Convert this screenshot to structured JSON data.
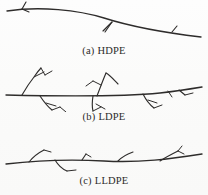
{
  "figure": {
    "background_color": "#fdfdfd",
    "ink_color": "#2e2c2b",
    "panel_count": 3
  },
  "panels": [
    {
      "id": "hdpe",
      "caption_tag": "(a)",
      "caption_label": "HDPE",
      "caption_full": "(a) HDPE",
      "description": "linear chain with very few short branches",
      "main_chain_path": "M 7,11 C 40,6 78,10 104,18 C 126,25 150,31 201,37",
      "branches": [
        "M 22,9 L 26,2",
        "M 22,9 L 29,12",
        "M 112,22 L 103,31",
        "M 112,22 L 105,32",
        "M 172,32 L 177,26"
      ]
    },
    {
      "id": "ldpe",
      "caption_tag": "(b)",
      "caption_label": "LDPE",
      "caption_full": "(b) LDPE",
      "description": "highly branched chain with long branches bearing sub-branches",
      "main_chain_path": "M 6,33 C 50,34 120,35 160,31 C 178,29 190,27 202,25",
      "branches": [
        "M 22,33 C 26,26 30,20 34,15 C 36,12 38,9 41,6",
        "M 34,15 L 44,10",
        "M 41,6 L 45,13",
        "M 45,13 L 52,9",
        "M 40,34 C 44,40 48,45 52,48",
        "M 46,41 L 56,44",
        "M 52,48 L 60,45",
        "M 60,45 L 66,50",
        "M 97,34 C 100,26 103,18 106,11",
        "M 106,11 C 110,13 114,18 118,22",
        "M 101,23 L 93,19",
        "M 93,19 L 86,24",
        "M 93,34 C 92,40 92,45 93,49",
        "M 93,49 L 101,45",
        "M 96,42 L 105,47",
        "M 143,32 C 146,38 150,43 154,46",
        "M 148,38 L 157,41",
        "M 154,46 L 162,43",
        "M 168,29 L 172,35",
        "M 179,28 L 185,33",
        "M 185,33 L 193,31"
      ]
    },
    {
      "id": "lldpe",
      "caption_tag": "(c)",
      "caption_label": "LLDPE",
      "caption_full": "(c) LLDPE",
      "description": "linear chain with numerous short branches",
      "main_chain_path": "M 6,38 C 40,34 70,33 104,35 C 140,37 170,33 202,28",
      "branches": [
        "M 29,36 C 33,31 38,27 44,24",
        "M 44,24 L 51,26",
        "M 55,34 C 58,39 62,43 67,45",
        "M 67,45 L 76,44",
        "M 82,34 L 86,28",
        "M 86,28 L 91,31",
        "M 118,35 C 122,31 127,28 133,26",
        "M 160,35 C 166,31 172,28 178,25",
        "M 178,25 L 182,20",
        "M 178,25 L 184,28"
      ]
    }
  ]
}
